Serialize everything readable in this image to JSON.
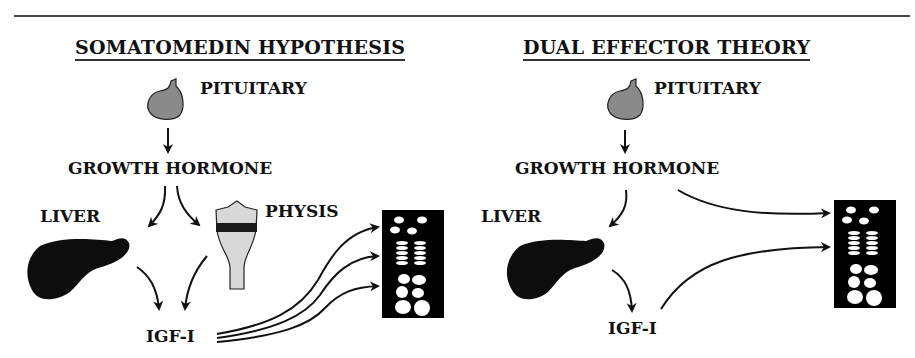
{
  "panels": [
    {
      "title": "SOMATOMEDIN HYPOTHESIS",
      "labels": {
        "pituitary": "PITUITARY",
        "growth_hormone": "GROWTH HORMONE",
        "liver": "LIVER",
        "physis": "PHYSIS",
        "igf": "IGF-I"
      }
    },
    {
      "title": "DUAL EFFECTOR THEORY",
      "labels": {
        "pituitary": "PITUITARY",
        "growth_hormone": "GROWTH HORMONE",
        "liver": "LIVER",
        "igf": "IGF-I"
      }
    }
  ],
  "colors": {
    "ink": "#111111",
    "gland_fill": "#8a8a8a",
    "physis_fill": "#d8d8d8",
    "physis_band": "#1a1a1a"
  }
}
